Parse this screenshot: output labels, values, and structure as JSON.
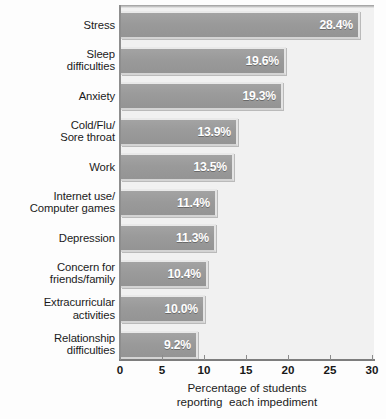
{
  "chart_data": {
    "type": "bar",
    "orientation": "horizontal",
    "title": "",
    "xlabel_lines": [
      "Percentage of students",
      "reporting  each impediment"
    ],
    "ylabel": "",
    "xlim": [
      0,
      30
    ],
    "xticks": [
      0,
      5,
      10,
      15,
      20,
      25,
      30
    ],
    "xtick_labels": [
      "0",
      "5",
      "10",
      "15",
      "20",
      "25",
      "30"
    ],
    "grid": false,
    "legend": "none",
    "value_suffix": "%",
    "categories": [
      "Stress",
      "Sleep difficulties",
      "Anxiety",
      "Cold/Flu/ Sore throat",
      "Work",
      "Internet use/ Computer games",
      "Depression",
      "Concern for friends/family",
      "Extracurricular activities",
      "Relationship difficulties"
    ],
    "category_label_lines": [
      [
        "Stress"
      ],
      [
        "Sleep",
        "difficulties"
      ],
      [
        "Anxiety"
      ],
      [
        "Cold/Flu/",
        "Sore throat"
      ],
      [
        "Work"
      ],
      [
        "Internet use/",
        "Computer games"
      ],
      [
        "Depression"
      ],
      [
        "Concern for",
        "friends/family"
      ],
      [
        "Extracurricular",
        "activities"
      ],
      [
        "Relationship",
        "difficulties"
      ]
    ],
    "values": [
      28.4,
      19.6,
      19.3,
      13.9,
      13.5,
      11.4,
      11.3,
      10.4,
      10.0,
      9.2
    ],
    "value_labels": [
      "28.4%",
      "19.6%",
      "19.3%",
      "13.9%",
      "13.5%",
      "11.4%",
      "11.3%",
      "10.4%",
      "10.0%",
      "9.2%"
    ],
    "colors": {
      "bar_fill": "#9a9a9a",
      "bar_highlight": "#e9e9e9",
      "bar_shadow": "#d4d4d4",
      "plot_background": "#f1f1f1",
      "page_background": "#fdfdfd",
      "axis": "#8c8c8c",
      "value_text": "#ffffff",
      "label_text": "#1b1b1b"
    }
  }
}
